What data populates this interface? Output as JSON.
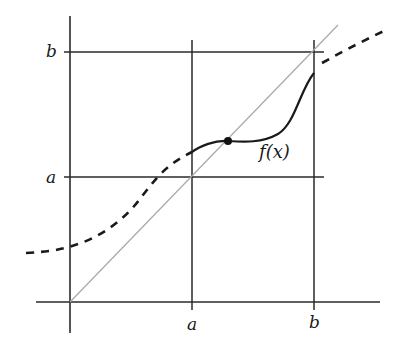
{
  "diagram": {
    "labels": {
      "y_axis_b": "b",
      "y_axis_a": "a",
      "x_axis_a": "a",
      "x_axis_b": "b",
      "function": "f(x)"
    },
    "colors": {
      "axis": "#2a2a2a",
      "grid_line": "#2a2a2a",
      "diagonal": "#a8a8a8",
      "curve": "#1a1a1a",
      "fixed_point": "#111111"
    },
    "elements": [
      "y-axis",
      "x-axis",
      "vertical line x = a",
      "vertical line x = b",
      "horizontal line y = a",
      "horizontal line y = b",
      "diagonal y = x",
      "curve f(x) solid on [a, b]",
      "curve f(x) dashed outside [a, b]",
      "fixed point where f(x) = x"
    ]
  }
}
